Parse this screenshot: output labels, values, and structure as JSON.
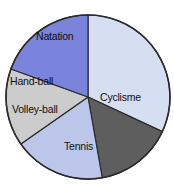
{
  "chart_data": {
    "type": "pie",
    "title": "",
    "subtitle": "",
    "xlabel": "",
    "ylabel": "",
    "legend_position": "none",
    "grid": false,
    "labels_inside_slices": true,
    "categories": [
      "Cyclisme",
      "Tennis",
      "Volley-ball",
      "Hand-ball",
      "Natation"
    ],
    "values": [
      115,
      55,
      65,
      55,
      70
    ],
    "value_unit": "degrees",
    "slices": [
      {
        "label": "Cyclisme",
        "angle_deg": 115,
        "start_deg": 0,
        "end_deg": 115,
        "color": "#d5dff1",
        "label_color": "#101010"
      },
      {
        "label": "Tennis",
        "angle_deg": 55,
        "start_deg": 115,
        "end_deg": 170,
        "color": "#5e5e5e",
        "label_color": "#101010"
      },
      {
        "label": "Volley-ball",
        "angle_deg": 65,
        "start_deg": 170,
        "end_deg": 235,
        "color": "#bcc6ea",
        "label_color": "#101010"
      },
      {
        "label": "Hand-ball",
        "angle_deg": 55,
        "start_deg": 235,
        "end_deg": 290,
        "color": "#cccccc",
        "label_color": "#101010"
      },
      {
        "label": "Natation",
        "angle_deg": 70,
        "start_deg": 290,
        "end_deg": 360,
        "color": "#7b84dc",
        "label_color": "#101010"
      }
    ],
    "geometry": {
      "center_x": 88,
      "center_y": 97,
      "radius": 82,
      "outline_color": "#2b2b2b",
      "separator_color": "#2b2b2b"
    },
    "background_color": "#ffffff"
  },
  "labels": {
    "cyclisme": "Cyclisme",
    "tennis": "Tennis",
    "volleyball": "Volley-ball",
    "handball": "Hand-ball",
    "natation": "Natation"
  }
}
